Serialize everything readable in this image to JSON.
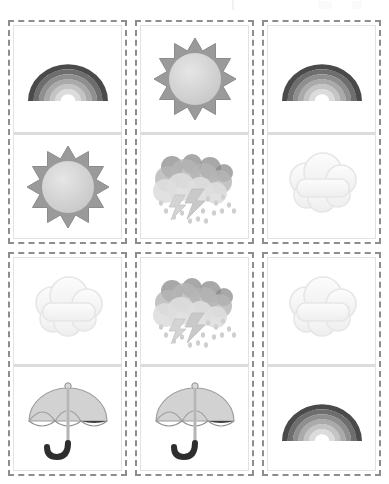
{
  "page": {
    "layout": "3-column by 2-row grid of dashed cards, each card split into two stacked picture cells",
    "background_color": "#ffffff",
    "card_border_color": "#8d8d8d",
    "card_border_style": "dashed",
    "cell_divider_color": "#dcdcdc",
    "columns": 3,
    "rows": 2
  },
  "palette": {
    "rainbow_band_1": "#4a4a4a",
    "rainbow_band_2": "#6e6e6e",
    "rainbow_band_3": "#8f8f8f",
    "rainbow_band_4": "#aaaaaa",
    "rainbow_band_5": "#c4c4c4",
    "rainbow_band_6": "#dcdcdc",
    "sun_ray": "#9a9a9a",
    "sun_disc": "#d6d6d6",
    "cloud_light": "#f4f4f4",
    "cloud_outline": "#e6e6e6",
    "storm_cloud_dark": "#8b8b8b",
    "storm_cloud_mid": "#b5b5b5",
    "storm_cloud_light": "#dedede",
    "rain_drop": "#cfcfcf",
    "umbrella_light": "#d2d2d2",
    "umbrella_dark": "#3f3f3f",
    "umbrella_handle": "#2e2e2e"
  },
  "cards": [
    {
      "id": "card-1",
      "position": "row-1-col-1",
      "cells": [
        {
          "id": "cell-1-top",
          "icon": "rainbow-icon",
          "label": "Rainbow"
        },
        {
          "id": "cell-1-bottom",
          "icon": "sun-icon",
          "label": "Sun"
        }
      ]
    },
    {
      "id": "card-2",
      "position": "row-1-col-2",
      "cells": [
        {
          "id": "cell-2-top",
          "icon": "sun-icon",
          "label": "Sun"
        },
        {
          "id": "cell-2-bottom",
          "icon": "storm-icon",
          "label": "Thunderstorm"
        }
      ]
    },
    {
      "id": "card-3",
      "position": "row-1-col-3",
      "cells": [
        {
          "id": "cell-3-top",
          "icon": "rainbow-icon",
          "label": "Rainbow"
        },
        {
          "id": "cell-3-bottom",
          "icon": "cloud-icon",
          "label": "Cloud"
        }
      ]
    },
    {
      "id": "card-4",
      "position": "row-2-col-1",
      "cells": [
        {
          "id": "cell-4-top",
          "icon": "cloud-icon",
          "label": "Cloud"
        },
        {
          "id": "cell-4-bottom",
          "icon": "umbrella-icon",
          "label": "Umbrella"
        }
      ]
    },
    {
      "id": "card-5",
      "position": "row-2-col-2",
      "cells": [
        {
          "id": "cell-5-top",
          "icon": "storm-icon",
          "label": "Thunderstorm"
        },
        {
          "id": "cell-5-bottom",
          "icon": "umbrella-icon",
          "label": "Umbrella"
        }
      ]
    },
    {
      "id": "card-6",
      "position": "row-2-col-3",
      "cells": [
        {
          "id": "cell-6-top",
          "icon": "cloud-icon",
          "label": "Cloud"
        },
        {
          "id": "cell-6-bottom",
          "icon": "rainbow-icon",
          "label": "Rainbow"
        }
      ]
    }
  ],
  "top_strip": {
    "visible": true,
    "description": "partially cut-off faint marks along the top edge",
    "marks": [
      {
        "type": "tick",
        "left": 232
      },
      {
        "type": "smudge",
        "left": 318,
        "width": 14
      },
      {
        "type": "smudge",
        "left": 352,
        "width": 10
      }
    ]
  }
}
